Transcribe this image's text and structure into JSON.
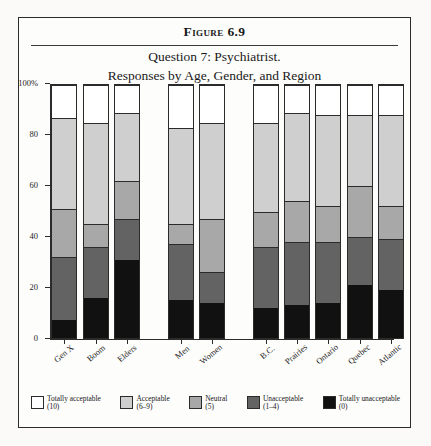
{
  "figure": {
    "caption": "Figure 6.9",
    "title_line_1": "Question 7: Psychiatrist.",
    "title_line_2": "Responses by Age, Gender, and Region"
  },
  "colors": {
    "totally_acceptable": "#ffffff",
    "acceptable": "#cfcfcf",
    "neutral": "#a8a8a8",
    "unacceptable": "#636363",
    "totally_unacceptable": "#111111",
    "axis": "#2b2b2b",
    "frame": "#2b2b2b",
    "page": "#fbfaf8"
  },
  "legend": {
    "items": [
      {
        "label": "Totally acceptable",
        "range": "(10)",
        "color": "#ffffff"
      },
      {
        "label": "Acceptable",
        "range": "(6–9)",
        "color": "#cfcfcf"
      },
      {
        "label": "Neutral",
        "range": "(5)",
        "color": "#a8a8a8"
      },
      {
        "label": "Unacceptable",
        "range": "(1–4)",
        "color": "#636363"
      },
      {
        "label": "Totally unacceptable",
        "range": "(0)",
        "color": "#111111"
      }
    ]
  },
  "chart_data": {
    "type": "bar",
    "subtype": "stacked-100-percent",
    "title": "Question 7: Psychiatrist. Responses by Age, Gender, and Region",
    "xlabel": "",
    "ylabel": "",
    "ylim": [
      0,
      100
    ],
    "yticks": [
      0,
      20,
      40,
      60,
      80,
      100
    ],
    "ytick_labels": [
      "0",
      "20",
      "40",
      "60",
      "80",
      "100%"
    ],
    "grid": false,
    "legend_position": "bottom",
    "categories": [
      "Gen X",
      "Boom",
      "Elders",
      "Men",
      "Women",
      "B.C.",
      "Prairies",
      "Ontario",
      "Quebec",
      "Atlantic"
    ],
    "groups": [
      {
        "name": "Age",
        "categories": [
          "Gen X",
          "Boom",
          "Elders"
        ]
      },
      {
        "name": "Gender",
        "categories": [
          "Men",
          "Women"
        ]
      },
      {
        "name": "Region",
        "categories": [
          "B.C.",
          "Prairies",
          "Ontario",
          "Quebec",
          "Atlantic"
        ]
      }
    ],
    "series": [
      {
        "name": "Totally unacceptable",
        "range": "(0)",
        "color": "#111111",
        "values": [
          7,
          16,
          31,
          15,
          14,
          12,
          13,
          14,
          21,
          19
        ]
      },
      {
        "name": "Unacceptable",
        "range": "(1–4)",
        "color": "#636363",
        "values": [
          25,
          20,
          16,
          22,
          12,
          24,
          25,
          24,
          19,
          20
        ]
      },
      {
        "name": "Neutral",
        "range": "(5)",
        "color": "#a8a8a8",
        "values": [
          19,
          9,
          15,
          8,
          21,
          14,
          16,
          14,
          20,
          13
        ]
      },
      {
        "name": "Acceptable",
        "range": "(6–9)",
        "color": "#cfcfcf",
        "values": [
          36,
          40,
          27,
          38,
          38,
          35,
          35,
          36,
          28,
          36
        ]
      },
      {
        "name": "Totally acceptable",
        "range": "(10)",
        "color": "#ffffff",
        "values": [
          13,
          15,
          11,
          17,
          15,
          15,
          11,
          12,
          12,
          12
        ]
      }
    ],
    "cumulative_tops": {
      "Gen X": [
        7,
        32,
        51,
        87,
        100
      ],
      "Boom": [
        16,
        36,
        45,
        85,
        100
      ],
      "Elders": [
        31,
        47,
        62,
        89,
        100
      ],
      "Men": [
        15,
        37,
        45,
        83,
        100
      ],
      "Women": [
        14,
        26,
        47,
        85,
        100
      ],
      "B.C.": [
        12,
        36,
        50,
        85,
        100
      ],
      "Prairies": [
        13,
        38,
        54,
        89,
        100
      ],
      "Ontario": [
        14,
        38,
        52,
        88,
        100
      ],
      "Quebec": [
        21,
        40,
        60,
        88,
        100
      ],
      "Atlantic": [
        19,
        39,
        52,
        88,
        100
      ]
    }
  },
  "layout": {
    "bar_left_percent": [
      4.2,
      13.3,
      22.4,
      38.0,
      47.1,
      62.7,
      71.8,
      80.9,
      90.0,
      99.1
    ],
    "bar_width_px": 26
  }
}
